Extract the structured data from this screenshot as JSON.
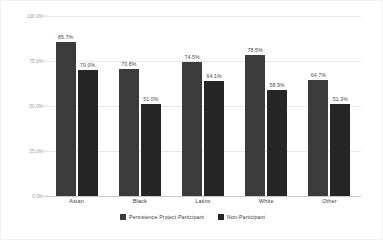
{
  "chart_data": {
    "type": "bar",
    "title": "",
    "subtitle": "",
    "xlabel": "",
    "ylabel": "",
    "categories": [
      "Asian",
      "Black",
      "Latinx",
      "White",
      "Other"
    ],
    "series": [
      {
        "name": "Persistence Project Participant",
        "color": "#3b3b3b",
        "values": [
          85.7,
          70.8,
          74.5,
          78.5,
          64.7
        ],
        "labels": [
          "85.7%",
          "70.8%",
          "74.5%",
          "78.5%",
          "64.7%"
        ]
      },
      {
        "name": "Non-Participant",
        "color": "#262626",
        "values": [
          70.0,
          51.0,
          64.1,
          58.9,
          51.3
        ],
        "labels": [
          "70.0%",
          "51.0%",
          "64.1%",
          "58.9%",
          "51.3%"
        ]
      }
    ],
    "ylim": [
      0,
      100
    ],
    "yticks": [
      100,
      75,
      50,
      25,
      0
    ],
    "ytick_labels": [
      "100.0%",
      "75.0%",
      "50.0%",
      "25.0%",
      "0.0%"
    ],
    "grid": true,
    "legend_position": "bottom",
    "value_labels_shown": true
  },
  "legend": {
    "items": [
      {
        "label": "Persistence Project Participant"
      },
      {
        "label": "Non-Participant"
      }
    ]
  },
  "colors": {
    "series_a": "#3b3b3b",
    "series_b": "#262626",
    "gridline": "#e8e8e8",
    "axis": "#c9c9c9",
    "tick_text": "#9a9a9a",
    "category_text": "#3d3d3d",
    "background": "#ffffff"
  }
}
